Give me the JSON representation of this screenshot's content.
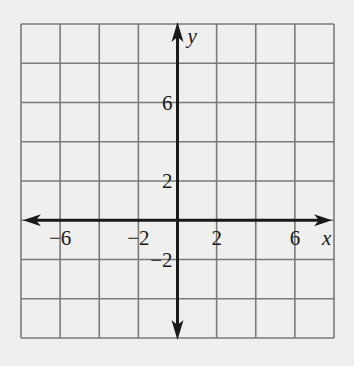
{
  "graph": {
    "title": "",
    "grid": {
      "x_min": -8,
      "x_max": 8,
      "y_min": -6,
      "y_max": 10,
      "step": 2,
      "columns": 8,
      "rows": 8
    },
    "axes": {
      "x_label": "x",
      "y_label": "y",
      "x_ticks": [
        {
          "value": -6,
          "label": "−6"
        },
        {
          "value": -2,
          "label": "−2"
        },
        {
          "value": 2,
          "label": "2"
        },
        {
          "value": 6,
          "label": "6"
        }
      ],
      "y_ticks": [
        {
          "value": 6,
          "label": "6"
        },
        {
          "value": 2,
          "label": "2"
        },
        {
          "value": -2,
          "label": "−2"
        }
      ]
    },
    "colors": {
      "background": "#efefed",
      "grid_line": "#7a7a7a",
      "axis": "#1a1a1a",
      "text": "#1a1a1a"
    }
  }
}
